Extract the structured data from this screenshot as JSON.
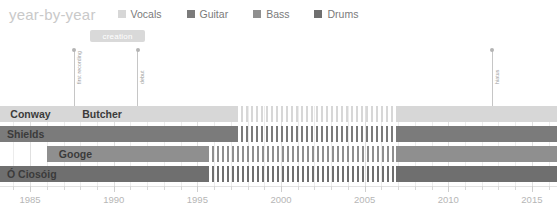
{
  "header": {
    "title": "year-by-year",
    "legend": [
      {
        "label": "Vocals",
        "color": "#d7d7d7",
        "icon": "square-swatch"
      },
      {
        "label": "Guitar",
        "color": "#7b7b7b",
        "icon": "square-swatch"
      },
      {
        "label": "Bass",
        "color": "#8f8f8f",
        "icon": "square-swatch"
      },
      {
        "label": "Drums",
        "color": "#6f6f6f",
        "icon": "square-swatch"
      }
    ]
  },
  "annotations": {
    "badge": {
      "label": "creation",
      "year": 1990.2,
      "color": "#d9d9d9"
    },
    "markers": [
      {
        "label": "first recording",
        "year": 1987.6
      },
      {
        "label": "debut",
        "year": 1991.4
      },
      {
        "label": "hiatus",
        "year": 2012.6
      }
    ]
  },
  "chart_data": {
    "type": "bar",
    "title": "year-by-year",
    "xlabel": "",
    "ylabel": "",
    "xlim": [
      1983.2,
      2016.5
    ],
    "grid": true,
    "legend_position": "top",
    "categories": [
      "Conway / Butcher",
      "Shields",
      "Googe",
      "Ó Ciosóig"
    ],
    "rows": [
      {
        "name": "Conway / Butcher",
        "labels": [
          {
            "text": "Conway",
            "year": 1983.4
          },
          {
            "text": "Butcher",
            "year": 1987.7
          }
        ],
        "color": "#d7d7d7",
        "role": "Vocals",
        "segments": [
          {
            "start": 1983.2,
            "end": 1987.6,
            "style": "solid"
          },
          {
            "start": 1987.6,
            "end": 1997.3,
            "style": "solid"
          },
          {
            "start": 1997.3,
            "end": 2006.9,
            "style": "hatch"
          },
          {
            "start": 2006.9,
            "end": 2016.5,
            "style": "solid"
          }
        ]
      },
      {
        "name": "Shields",
        "labels": [
          {
            "text": "Shields",
            "year": 1983.2
          }
        ],
        "color": "#7b7b7b",
        "role": "Guitar",
        "segments": [
          {
            "start": 1983.2,
            "end": 1997.3,
            "style": "solid"
          },
          {
            "start": 1997.3,
            "end": 2006.9,
            "style": "hatch"
          },
          {
            "start": 2006.9,
            "end": 2016.5,
            "style": "solid"
          }
        ]
      },
      {
        "name": "Googe",
        "labels": [
          {
            "text": "Googe",
            "year": 1986.3
          }
        ],
        "color": "#8f8f8f",
        "role": "Bass",
        "segments": [
          {
            "start": 1986.0,
            "end": 1995.6,
            "style": "solid"
          },
          {
            "start": 1995.6,
            "end": 2006.9,
            "style": "hatch"
          },
          {
            "start": 2006.9,
            "end": 2016.5,
            "style": "solid"
          }
        ]
      },
      {
        "name": "Ó Ciosóig",
        "labels": [
          {
            "text": "Ó Ciosóig",
            "year": 1983.2
          }
        ],
        "color": "#6f6f6f",
        "role": "Drums",
        "segments": [
          {
            "start": 1983.2,
            "end": 1995.6,
            "style": "solid"
          },
          {
            "start": 1995.6,
            "end": 2006.9,
            "style": "hatch"
          },
          {
            "start": 2006.9,
            "end": 2016.5,
            "style": "solid"
          }
        ]
      }
    ],
    "axis": {
      "tick_labels": [
        "1985",
        "1990",
        "1995",
        "2000",
        "2005",
        "2010",
        "2015"
      ],
      "tick_values": [
        1985,
        1990,
        1995,
        2000,
        2005,
        2010,
        2015
      ],
      "minor_step": 1
    }
  }
}
